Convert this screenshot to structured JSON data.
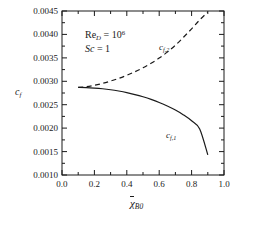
{
  "chart_data": {
    "type": "line",
    "title": "",
    "xlabel": "chi-bar_B0",
    "ylabel": "c_f",
    "xlim": [
      0.0,
      1.0
    ],
    "ylim": [
      0.001,
      0.0045
    ],
    "grid": false,
    "legend_position": "inline-curve-labels",
    "xticks": [
      "0.0",
      "0.2",
      "0.4",
      "0.6",
      "0.8",
      "1.0"
    ],
    "xtick_values": [
      0.0,
      0.2,
      0.4,
      0.6,
      0.8,
      1.0
    ],
    "yticks": [
      "0.0010",
      "0.0015",
      "0.0020",
      "0.0025",
      "0.0030",
      "0.0035",
      "0.0040",
      "0.0045"
    ],
    "ytick_values": [
      0.001,
      0.0015,
      0.002,
      0.0025,
      0.003,
      0.0035,
      0.004,
      0.0045
    ],
    "x": [
      0.1,
      0.15,
      0.2,
      0.25,
      0.3,
      0.35,
      0.4,
      0.45,
      0.5,
      0.55,
      0.6,
      0.65,
      0.7,
      0.75,
      0.8,
      0.85,
      0.9
    ],
    "series": [
      {
        "name": "c_f,1",
        "style": "solid",
        "color": "#1a1a1a",
        "values": [
          0.00287,
          0.002866,
          0.002856,
          0.002841,
          0.00282,
          0.002792,
          0.002758,
          0.002717,
          0.002669,
          0.002613,
          0.002548,
          0.002473,
          0.002386,
          0.002283,
          0.002157,
          0.001983,
          0.00143
        ]
      },
      {
        "name": "c_f,2",
        "style": "dashed",
        "color": "#1a1a1a",
        "values": [
          0.00287,
          0.002885,
          0.002915,
          0.002955,
          0.003005,
          0.003062,
          0.003128,
          0.003203,
          0.003288,
          0.003385,
          0.003495,
          0.003622,
          0.00377,
          0.00394,
          0.00412,
          0.00431,
          0.00448
        ]
      }
    ],
    "annotations": [
      {
        "name": "reynolds-number",
        "text": "Re_D = 10^6",
        "x": 0.18,
        "y": 0.00405
      },
      {
        "name": "schmidt-number",
        "text": "Sc = 1",
        "x": 0.18,
        "y": 0.00378
      }
    ],
    "curve_labels": [
      {
        "name": "curve-label-cf2",
        "text": "c_f,2",
        "x": 0.62,
        "y": 0.00372
      },
      {
        "name": "curve-label-cf1",
        "text": "c_f,1",
        "x": 0.66,
        "y": 0.00208
      }
    ]
  },
  "axes": {
    "y_title_main": "c",
    "y_title_sub": "f",
    "x_title_main": "χ",
    "x_title_sub": "B0",
    "ytick_labels": [
      "0.0045",
      "0.0040",
      "0.0035",
      "0.0030",
      "0.0025",
      "0.0020",
      "0.0015",
      "0.0010"
    ],
    "xtick_labels": [
      "0.0",
      "0.2",
      "0.4",
      "0.6",
      "0.8",
      "1.0"
    ]
  },
  "annotations": {
    "reynolds": {
      "symbol": "Re",
      "subscript": "D",
      "equals": " = 10",
      "exponent": "6"
    },
    "schmidt": {
      "symbol": "Sc",
      "equals": " = 1"
    }
  },
  "curve_labels": {
    "cf2": {
      "symbol": "c",
      "subscript": "f,2"
    },
    "cf1": {
      "symbol": "c",
      "subscript": "f,1"
    }
  },
  "colors": {
    "axis": "#1a1a1a",
    "curve": "#1a1a1a",
    "background": "#ffffff"
  }
}
